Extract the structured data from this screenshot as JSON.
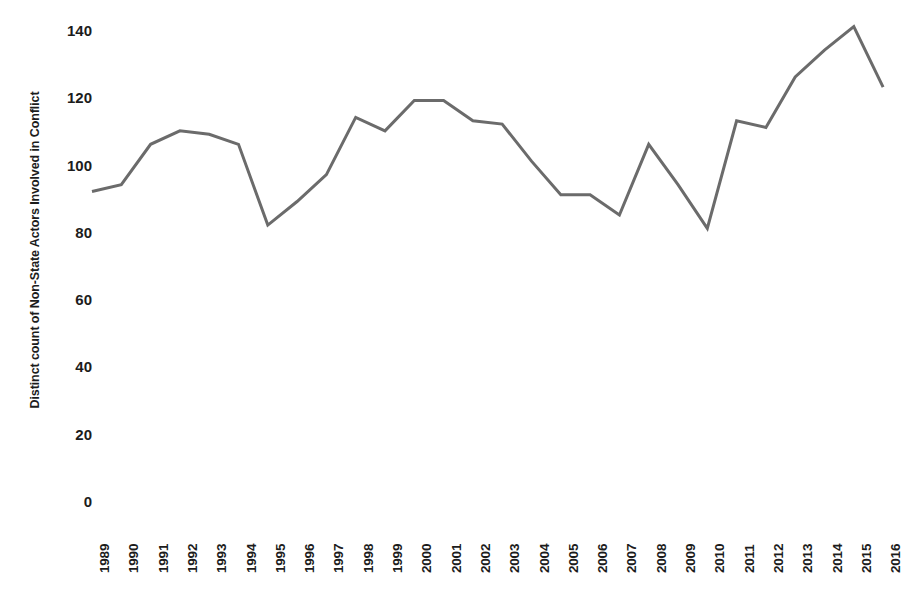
{
  "chart_data": {
    "type": "line",
    "title": "",
    "xlabel": "",
    "ylabel": "Distinct count of Non-State Actors Involved in Conflict",
    "categories": [
      "1989",
      "1990",
      "1991",
      "1992",
      "1993",
      "1994",
      "1995",
      "1996",
      "1997",
      "1998",
      "1999",
      "2000",
      "2001",
      "2002",
      "2003",
      "2004",
      "2005",
      "2006",
      "2007",
      "2008",
      "2009",
      "2010",
      "2011",
      "2012",
      "2013",
      "2014",
      "2015",
      "2016"
    ],
    "values": [
      92,
      94,
      106,
      110,
      109,
      106,
      82,
      89,
      97,
      114,
      110,
      119,
      119,
      113,
      112,
      101,
      91,
      91,
      85,
      106,
      94,
      81,
      113,
      111,
      126,
      134,
      141,
      123
    ],
    "series": [
      {
        "name": "Distinct count of Non-State Actors Involved in Conflict",
        "values": [
          92,
          94,
          106,
          110,
          109,
          106,
          82,
          89,
          97,
          114,
          110,
          119,
          119,
          113,
          112,
          101,
          91,
          91,
          85,
          106,
          94,
          81,
          113,
          111,
          126,
          134,
          141,
          123
        ],
        "color": "#6b6b6b"
      }
    ],
    "y_ticks": [
      0,
      20,
      40,
      60,
      80,
      100,
      120,
      140
    ],
    "y_tick_labels": [
      "0",
      "20",
      "40",
      "60",
      "80",
      "100",
      "120",
      "140"
    ],
    "ylim": [
      0,
      148
    ],
    "grid": false,
    "legend": "none",
    "line_color": "#6b6b6b",
    "line_width": 3,
    "background_color": "#ffffff",
    "text_color": "#1c1c1c"
  }
}
